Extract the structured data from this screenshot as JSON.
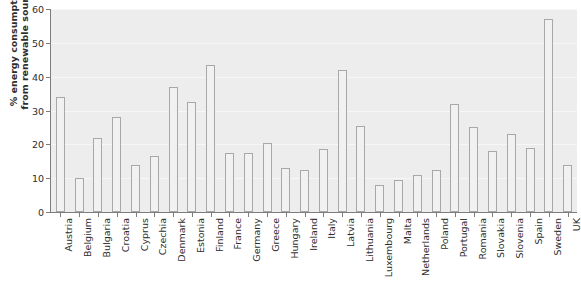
{
  "chart_data": {
    "type": "bar",
    "title": "",
    "subtitle": "",
    "xlabel": "",
    "ylabel": "% energy consumption from renewable sources",
    "ylabel_lines": [
      "% energy consumption",
      "from renewable sources"
    ],
    "ylim": [
      0,
      60
    ],
    "ytick_labels": [
      "0",
      "10",
      "20",
      "30",
      "40",
      "50",
      "60"
    ],
    "ytick_values": [
      0,
      10,
      20,
      30,
      40,
      50,
      60
    ],
    "grid": true,
    "grid_axis": "y",
    "legend": false,
    "legend_position": "none",
    "categories": [
      "Austria",
      "Belgium",
      "Bulgaria",
      "Croatia",
      "Cyprus",
      "Czechia",
      "Denmark",
      "Estonia",
      "Finland",
      "France",
      "Germany",
      "Greece",
      "Hungary",
      "Ireland",
      "Italy",
      "Latvia",
      "Lithuania",
      "Luxembourg",
      "Malta",
      "Netherlands",
      "Poland",
      "Portugal",
      "Romania",
      "Slovakia",
      "Slovenia",
      "Spain",
      "Sweden",
      "UK"
    ],
    "values": [
      34,
      10,
      22,
      28,
      14,
      16.5,
      37,
      32.5,
      43.5,
      17.5,
      17.5,
      20.5,
      13,
      12.5,
      18.5,
      42,
      25.5,
      8,
      9.5,
      11,
      12.5,
      32,
      25,
      18,
      23,
      19,
      57,
      14
    ],
    "bar_fill_color": "#f1f1f1",
    "bar_edge_color": "#a8a8a8",
    "plot_background_color": "#ededed",
    "gridline_color": "#f7f7f7",
    "axis_color": "#7d7d7d",
    "text_color": "#2e2e2e"
  }
}
